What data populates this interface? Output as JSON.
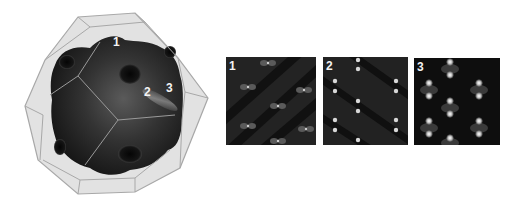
{
  "figure": {
    "polyhedron": {
      "shape": "truncated-octahedron-wireframe",
      "surface": "dark-isosurface-with-holes",
      "labels": [
        {
          "text": "1",
          "x": 113,
          "y": 36
        },
        {
          "text": "2",
          "x": 144,
          "y": 86
        },
        {
          "text": "3",
          "x": 166,
          "y": 82
        }
      ],
      "colors": {
        "cage_edge": "#a8a8a8",
        "cage_fill": "#dcdcdc",
        "surface": "#2a2a2a"
      }
    },
    "panels": [
      {
        "label": "1",
        "pattern": "diagonal-bowtie-lobes",
        "background": "#232323"
      },
      {
        "label": "2",
        "pattern": "diagonal-paired-bright-spots",
        "background": "#222222"
      },
      {
        "label": "3",
        "pattern": "p-orbital-lattice",
        "background": "#0e0e0e"
      }
    ]
  }
}
